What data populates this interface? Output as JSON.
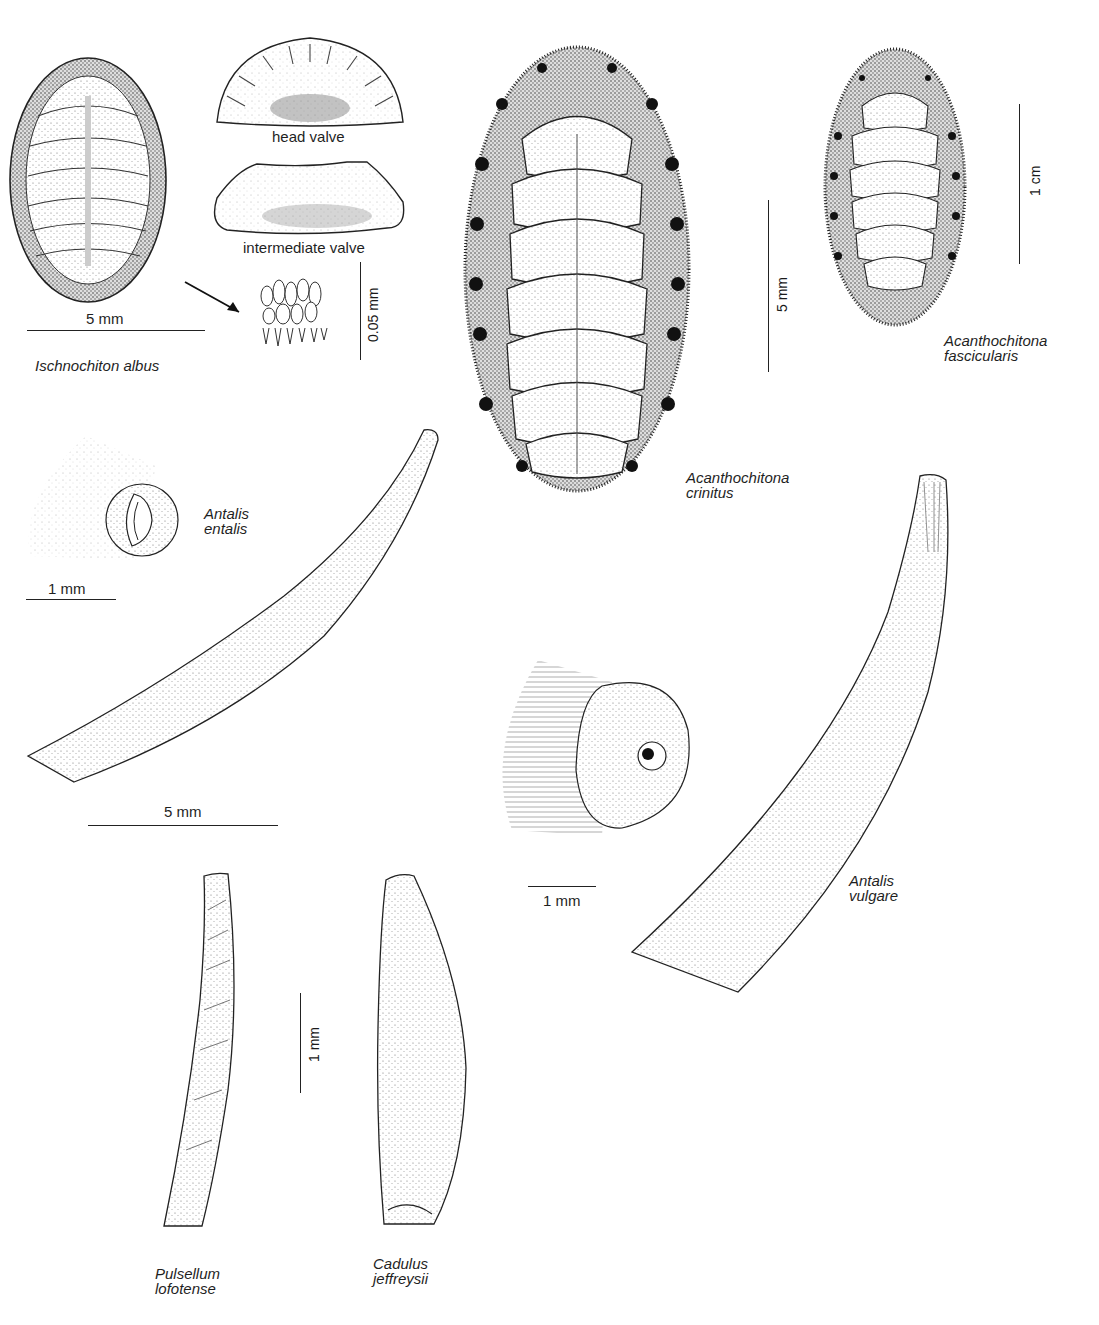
{
  "plate": {
    "figures": {
      "ischnochiton": {
        "species": "Ischnochiton albus",
        "scale": "5 mm",
        "head_valve_label": "head valve",
        "intermediate_valve_label": "intermediate valve",
        "girdle_scale": "0.05 mm"
      },
      "acanthochitona_crinitus": {
        "species_line1": "Acanthochitona",
        "species_line2": "crinitus",
        "scale": "5 mm"
      },
      "acanthochitona_fascicularis": {
        "species_line1": "Acanthochitona",
        "species_line2": "fascicularis",
        "scale": "1 cm"
      },
      "antalis_entalis": {
        "species_line1": "Antalis",
        "species_line2": "entalis",
        "detail_scale": "1 mm",
        "shell_scale": "5 mm"
      },
      "antalis_vulgare": {
        "species_line1": "Antalis",
        "species_line2": "vulgare",
        "detail_scale": "1 mm"
      },
      "pulsellum": {
        "species_line1": "Pulsellum",
        "species_line2": "lofotense",
        "scale": "1 mm"
      },
      "cadulus": {
        "species_line1": "Cadulus",
        "species_line2": "jeffreysii"
      }
    },
    "colors": {
      "ink": "#1f1f1f",
      "paper": "#ffffff",
      "stipple": "#9a9a9a"
    }
  }
}
